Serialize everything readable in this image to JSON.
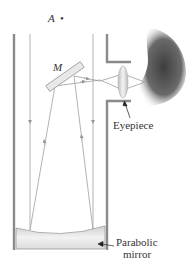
{
  "diagram": {
    "labels": {
      "point_a": "A",
      "point_a_dot": "•",
      "mirror_m": "M",
      "eyepiece": "Eyepiece",
      "parabolic_line1": "Parabolic",
      "parabolic_line2": "mirror"
    },
    "colors": {
      "tube_wall": "#8a8a8a",
      "rays": "#9a9a9a",
      "mirror_fill": "#e6e6e6",
      "eye_shadow": "#555555",
      "text": "#333333"
    }
  }
}
